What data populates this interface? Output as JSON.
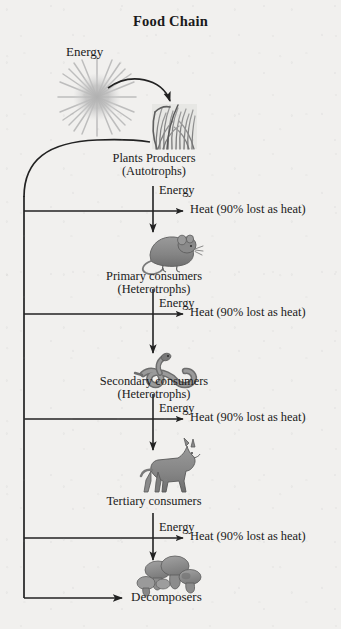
{
  "title": "Food Chain",
  "colors": {
    "background": "#f1f0ee",
    "ink": "#1a1a1a",
    "line": "#2b2b2b",
    "organism_gray": "#8d8d8d",
    "organism_dark": "#6a6a6a",
    "sun_gray": "#b9b9b9"
  },
  "energy_source": {
    "label": "Energy",
    "icon": "sun-icon",
    "arrow": "curved-arrow-sun-to-plants"
  },
  "levels": [
    {
      "id": "producers",
      "icon": "grass-plants-icon",
      "name": "Plants Producers",
      "sub": "(Autotrophs)",
      "energy_label": "Energy",
      "heat_label": "Heat (90% lost as heat)"
    },
    {
      "id": "primary-consumers",
      "icon": "mouse-icon",
      "name": "Primary consumers",
      "sub": "(Heterotrophs)",
      "energy_label": "Energy",
      "heat_label": "Heat (90% lost as heat)"
    },
    {
      "id": "secondary-consumers",
      "icon": "snake-icon",
      "name": "Secondary consumers",
      "sub": "(Heterotrophs)",
      "energy_label": "Energy",
      "heat_label": "Heat (90% lost as heat)"
    },
    {
      "id": "tertiary-consumers",
      "icon": "wolf-icon",
      "name": "Tertiary consumers",
      "sub": "",
      "energy_label": "Energy",
      "heat_label": "Heat (90% lost as heat)"
    }
  ],
  "decomposers": {
    "id": "decomposers",
    "icon": "mushrooms-icon",
    "name": "Decomposers"
  },
  "recycling_path": {
    "name": "nutrient-recycling-loop",
    "description": "left vertical line collecting from each trophic level and returning to producers"
  }
}
